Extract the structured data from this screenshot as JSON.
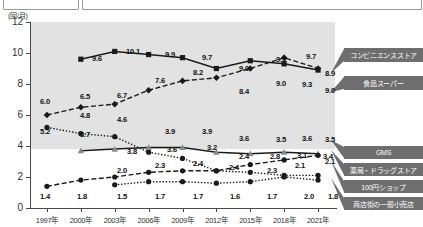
{
  "top_boxes": [
    {
      "name": "top-box-left",
      "text": ""
    },
    {
      "name": "top-box-right",
      "text": ""
    }
  ],
  "axis": {
    "unit_label": "(回/月)",
    "y_ticks": [
      "0",
      "2",
      "4",
      "6",
      "8",
      "10",
      "12"
    ],
    "x_ticks": [
      "1997年",
      "2000年",
      "2003年",
      "2006年",
      "2009年",
      "2012年",
      "2015年",
      "2018年",
      "2021年"
    ]
  },
  "legend": [
    {
      "label": "コンビニエンスストア"
    },
    {
      "label": "食品スーパー"
    },
    {
      "label": "GMS"
    },
    {
      "label": "薬局・ドラッグストア"
    },
    {
      "label": "100円ショップ"
    },
    {
      "label": "商店街の一般小売店"
    }
  ],
  "colors": {
    "plot_band": "#e2e2e2",
    "legend_box": "#6e6e6e",
    "legend_text": "#ffffff",
    "line": "#1a1a1a",
    "axis": "#4a4a4a"
  },
  "chart_data": {
    "type": "line",
    "title": "",
    "xlabel": "",
    "ylabel": "(回/月)",
    "ylim": [
      0,
      12
    ],
    "grid": false,
    "legend_position": "right",
    "categories": [
      "1997年",
      "2000年",
      "2003年",
      "2006年",
      "2009年",
      "2012年",
      "2015年",
      "2018年",
      "2021年"
    ],
    "series": [
      {
        "name": "コンビニエンスストア",
        "marker": "square",
        "linestyle": "solid",
        "x": [
          "2000年",
          "2003年",
          "2006年",
          "2009年",
          "2012年",
          "2015年",
          "2018年",
          "2021年"
        ],
        "values": [
          9.6,
          10.1,
          9.9,
          9.7,
          9.0,
          9.5,
          9.3,
          8.9
        ]
      },
      {
        "name": "食品スーパー",
        "marker": "diamond",
        "linestyle": "dashed",
        "x": [
          "1997年",
          "2000年",
          "2003年",
          "2006年",
          "2009年",
          "2012年",
          "2015年",
          "2018年",
          "2021年"
        ],
        "values": [
          6.0,
          6.5,
          6.7,
          7.6,
          8.2,
          8.4,
          9.0,
          9.7,
          9.0
        ]
      },
      {
        "name": "GMS",
        "marker": "circle",
        "linestyle": "dotted",
        "x": [
          "1997年",
          "2000年",
          "2003年",
          "2006年",
          "2009年",
          "2012年",
          "2015年",
          "2018年",
          "2021年"
        ],
        "values": [
          5.2,
          4.8,
          4.6,
          3.6,
          3.2,
          2.4,
          2.3,
          2.1,
          2.1
        ]
      },
      {
        "name": "薬局・ドラッグストア",
        "marker": "triangle",
        "linestyle": "solid",
        "x": [
          "2000年",
          "2003年",
          "2006年",
          "2009年",
          "2012年",
          "2015年",
          "2018年",
          "2021年"
        ],
        "values": [
          3.7,
          3.8,
          3.9,
          3.9,
          3.6,
          3.5,
          3.6,
          3.5
        ]
      },
      {
        "name": "100円ショップ",
        "marker": "circle",
        "linestyle": "dashed",
        "x": [
          "1997年",
          "2000年",
          "2003年",
          "2006年",
          "2009年",
          "2012年",
          "2015年",
          "2018年",
          "2021年"
        ],
        "values": [
          1.4,
          1.8,
          2.0,
          2.3,
          2.4,
          2.4,
          2.8,
          3.1,
          3.4
        ]
      },
      {
        "name": "商店街の一般小売店",
        "marker": "circle-filled",
        "linestyle": "dotted",
        "x": [
          "2003年",
          "2006年",
          "2009年",
          "2012年",
          "2015年",
          "2018年",
          "2021年"
        ],
        "values": [
          1.5,
          1.7,
          1.7,
          1.6,
          1.7,
          2.0,
          1.8
        ]
      }
    ],
    "point_labels": [
      {
        "series": "コンビニエンスストア",
        "x": "2000年",
        "text": "9.6",
        "px": 97,
        "py": 40
      },
      {
        "series": "コンビニエンスストア",
        "x": "2003年",
        "text": "10.1",
        "px": 133,
        "py": 33
      },
      {
        "series": "コンビニエンスストア",
        "x": "2006年",
        "text": "9.9",
        "px": 170,
        "py": 36
      },
      {
        "series": "コンビニエンスストア",
        "x": "2009年",
        "text": "9.7",
        "px": 207,
        "py": 39
      },
      {
        "series": "コンビニエンスストア",
        "x": "2012年",
        "text": "9.0",
        "px": 244,
        "py": 50
      },
      {
        "series": "コンビニエンスストア",
        "x": "2015年",
        "text": "9.5",
        "px": 281,
        "py": 41
      },
      {
        "series": "コンビニエンスストア",
        "x": "2018年",
        "text": "9.3",
        "px": 307,
        "py": 66
      },
      {
        "series": "コンビニエンスストア",
        "x": "2021年",
        "text": "8.9",
        "px": 330,
        "py": 55
      },
      {
        "series": "食品スーパー",
        "x": "1997年",
        "text": "6.0",
        "px": 45,
        "py": 83
      },
      {
        "series": "食品スーパー",
        "x": "2000年",
        "text": "6.5",
        "px": 85,
        "py": 78
      },
      {
        "series": "食品スーパー",
        "x": "2003年",
        "text": "6.7",
        "px": 122,
        "py": 77
      },
      {
        "series": "食品スーパー",
        "x": "2006年",
        "text": "7.6",
        "px": 160,
        "py": 62
      },
      {
        "series": "食品スーパー",
        "x": "2009年",
        "text": "8.2",
        "px": 198,
        "py": 54
      },
      {
        "series": "食品スーパー",
        "x": "2012年",
        "text": "8.4",
        "px": 244,
        "py": 73
      },
      {
        "series": "食品スーパー",
        "x": "2015年",
        "text": "9.0",
        "px": 281,
        "py": 65
      },
      {
        "series": "食品スーパー",
        "x": "2018年",
        "text": "9.7",
        "px": 311,
        "py": 38
      },
      {
        "series": "食品スーパー",
        "x": "2021年",
        "text": "9.0",
        "px": 330,
        "py": 72
      },
      {
        "series": "GMS",
        "x": "1997年",
        "text": "5.2",
        "px": 45,
        "py": 113
      },
      {
        "series": "GMS",
        "x": "2000年",
        "text": "4.8",
        "px": 85,
        "py": 97
      },
      {
        "series": "GMS",
        "x": "2003年",
        "text": "4.6",
        "px": 122,
        "py": 101
      },
      {
        "series": "GMS",
        "x": "2006年",
        "text": "3.6",
        "px": 172,
        "py": 131
      },
      {
        "series": "GMS",
        "x": "2009年",
        "text": "3.2",
        "px": 212,
        "py": 129
      },
      {
        "series": "GMS",
        "x": "2012年",
        "text": "2.4",
        "px": 234,
        "py": 149
      },
      {
        "series": "GMS",
        "x": "2015年",
        "text": "2.3",
        "px": 272,
        "py": 152
      },
      {
        "series": "GMS",
        "x": "2018年",
        "text": "2.1",
        "px": 300,
        "py": 147
      },
      {
        "series": "GMS",
        "x": "2021年",
        "text": "2.1",
        "px": 330,
        "py": 143
      },
      {
        "series": "薬局・ドラッグストア",
        "x": "2000年",
        "text": "3.7",
        "px": 85,
        "py": 116
      },
      {
        "series": "薬局・ドラッグストア",
        "x": "2003年",
        "text": "3.8",
        "px": 132,
        "py": 133
      },
      {
        "series": "薬局・ドラッグストア",
        "x": "2006年",
        "text": "3.9",
        "px": 170,
        "py": 113
      },
      {
        "series": "薬局・ドラッグストア",
        "x": "2009年",
        "text": "3.9",
        "px": 207,
        "py": 113
      },
      {
        "series": "薬局・ドラッグストア",
        "x": "2012年",
        "text": "3.6",
        "px": 244,
        "py": 120
      },
      {
        "series": "薬局・ドラッグストア",
        "x": "2015年",
        "text": "3.5",
        "px": 281,
        "py": 121
      },
      {
        "series": "薬局・ドラッグストア",
        "x": "2018年",
        "text": "3.6",
        "px": 307,
        "py": 120
      },
      {
        "series": "薬局・ドラッグストア",
        "x": "2021年",
        "text": "3.5",
        "px": 330,
        "py": 121
      },
      {
        "series": "100円ショップ",
        "x": "1997年",
        "text": "1.4",
        "px": 45,
        "py": 178
      },
      {
        "series": "100円ショップ",
        "x": "2000年",
        "text": "1.8",
        "px": 82,
        "py": 178
      },
      {
        "series": "100円ショップ",
        "x": "2003年",
        "text": "2.0",
        "px": 122,
        "py": 152
      },
      {
        "series": "100円ショップ",
        "x": "2006年",
        "text": "2.3",
        "px": 160,
        "py": 147
      },
      {
        "series": "100円ショップ",
        "x": "2009年",
        "text": "2.4",
        "px": 198,
        "py": 145
      },
      {
        "series": "100円ショップ",
        "x": "2012年",
        "text": "2.4",
        "px": 244,
        "py": 138
      },
      {
        "series": "100円ショップ",
        "x": "2015年",
        "text": "2.8",
        "px": 275,
        "py": 138
      },
      {
        "series": "100円ショップ",
        "x": "2018年",
        "text": "3.1",
        "px": 302,
        "py": 137
      },
      {
        "series": "100円ショップ",
        "x": "2021年",
        "text": "3.4",
        "px": 328,
        "py": 138
      },
      {
        "series": "商店街の一般小売店",
        "x": "2003年",
        "text": "1.5",
        "px": 122,
        "py": 178
      },
      {
        "series": "商店街の一般小売店",
        "x": "2006年",
        "text": "1.7",
        "px": 160,
        "py": 178
      },
      {
        "series": "商店街の一般小売店",
        "x": "2009年",
        "text": "1.7",
        "px": 198,
        "py": 178
      },
      {
        "series": "商店街の一般小売店",
        "x": "2012年",
        "text": "1.6",
        "px": 235,
        "py": 178
      },
      {
        "series": "商店街の一般小売店",
        "x": "2015年",
        "text": "1.7",
        "px": 272,
        "py": 178
      },
      {
        "series": "商店街の一般小売店",
        "x": "2018年",
        "text": "2.0",
        "px": 309,
        "py": 178
      },
      {
        "series": "商店街の一般小売店",
        "x": "2021年",
        "text": "1.8",
        "px": 333,
        "py": 178
      }
    ]
  }
}
